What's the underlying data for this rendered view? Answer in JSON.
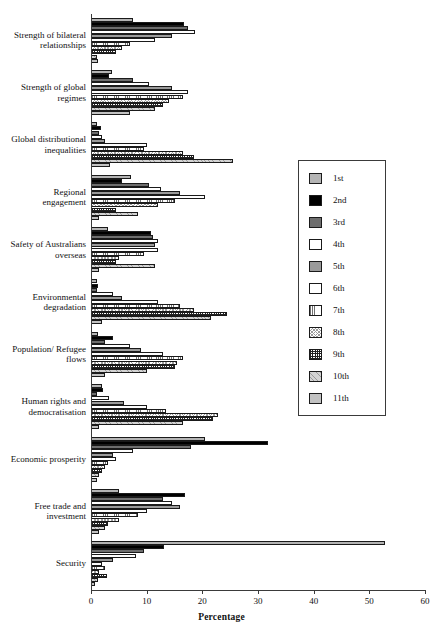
{
  "chart_data": {
    "type": "bar",
    "orientation": "horizontal",
    "title": "",
    "xlabel": "Percentage",
    "ylabel": "",
    "xlim": [
      0,
      60
    ],
    "xticks": [
      0,
      10,
      20,
      30,
      40,
      50,
      60
    ],
    "grid": false,
    "legend_position": "right-middle",
    "legend_entries": [
      "1st",
      "2nd",
      "3rd",
      "4th",
      "5th",
      "6th",
      "7th",
      "8th",
      "9th",
      "10th",
      "11th"
    ],
    "categories": [
      "Strength of bilateral relationships",
      "Strength of global regimes",
      "Global distributional inequalities",
      "Regional engagement",
      "Safety of Australians overseas",
      "Environmental degradation",
      "Population/ Refugee flows",
      "Human rights and democratisation",
      "Economic prosperity",
      "Free trade and investment",
      "Security"
    ],
    "series": [
      {
        "name": "1st",
        "values": [
          7.5,
          3.7,
          1.0,
          7.2,
          3.0,
          1.0,
          1.2,
          2.0,
          20.5,
          5.0,
          52.8
        ]
      },
      {
        "name": "2nd",
        "values": [
          16.7,
          3.2,
          1.8,
          5.5,
          10.7,
          1.3,
          4.0,
          2.2,
          31.8,
          16.9,
          13.2
        ]
      },
      {
        "name": "3rd",
        "values": [
          17.4,
          7.5,
          1.5,
          10.5,
          11.2,
          1.0,
          2.5,
          1.0,
          18.0,
          13.0,
          9.5
        ]
      },
      {
        "name": "4th",
        "values": [
          18.7,
          10.5,
          2.0,
          12.5,
          12.0,
          4.0,
          7.0,
          3.2,
          7.5,
          14.5,
          8.0
        ]
      },
      {
        "name": "5th",
        "values": [
          14.5,
          14.5,
          2.5,
          16.0,
          11.5,
          5.5,
          9.0,
          6.0,
          4.0,
          16.0,
          4.0
        ]
      },
      {
        "name": "6th",
        "values": [
          11.5,
          17.5,
          10.0,
          20.5,
          12.0,
          12.0,
          13.0,
          10.0,
          4.5,
          10.0,
          2.0
        ]
      },
      {
        "name": "7th",
        "values": [
          7.0,
          16.5,
          9.5,
          15.0,
          9.5,
          16.0,
          16.5,
          13.5,
          3.0,
          8.5,
          2.5
        ]
      },
      {
        "name": "8th",
        "values": [
          5.5,
          14.0,
          16.5,
          12.0,
          5.0,
          18.5,
          15.5,
          22.8,
          2.5,
          5.0,
          1.5
        ]
      },
      {
        "name": "9th",
        "values": [
          4.5,
          13.0,
          18.5,
          4.5,
          4.5,
          24.4,
          15.0,
          22.0,
          2.0,
          3.0,
          2.8
        ]
      },
      {
        "name": "10th",
        "values": [
          1.0,
          11.5,
          25.5,
          8.5,
          11.5,
          21.5,
          10.0,
          16.5,
          1.5,
          2.5,
          1.2
        ]
      },
      {
        "name": "11th",
        "values": [
          1.2,
          7.0,
          3.5,
          1.5,
          1.5,
          2.0,
          2.5,
          1.5,
          1.0,
          1.5,
          0.8
        ]
      }
    ]
  }
}
